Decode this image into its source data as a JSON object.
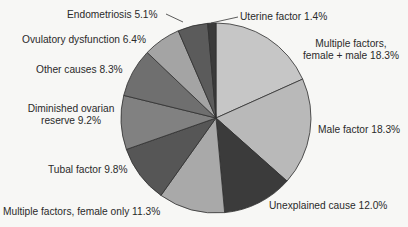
{
  "chart_data": {
    "type": "pie",
    "title": "",
    "start_angle_deg": 0,
    "direction": "clockwise",
    "center": [
      216,
      118
    ],
    "radius": 95,
    "slices": [
      {
        "label": "Multiple factors, female + male",
        "value": 18.3,
        "color": "#c6c6c6"
      },
      {
        "label": "Male factor",
        "value": 18.3,
        "color": "#b9b9b9"
      },
      {
        "label": "Unexplained cause",
        "value": 12.0,
        "color": "#3b3b3b"
      },
      {
        "label": "Multiple factors, female only",
        "value": 11.3,
        "color": "#a9a9a9"
      },
      {
        "label": "Tubal factor",
        "value": 9.8,
        "color": "#565656"
      },
      {
        "label": "Diminished ovarian reserve",
        "value": 9.2,
        "color": "#818181"
      },
      {
        "label": "Other causes",
        "value": 8.3,
        "color": "#6f6f6f"
      },
      {
        "label": "Ovulatory dysfunction",
        "value": 6.4,
        "color": "#a4a4a4"
      },
      {
        "label": "Endometriosis",
        "value": 5.1,
        "color": "#5b5b5b"
      },
      {
        "label": "Uterine factor",
        "value": 1.4,
        "color": "#3a3a3a"
      }
    ]
  },
  "labels": {
    "mf_line1": "Multiple factors,",
    "mf_line2": "female + male 18.3%",
    "male": "Male factor 18.3%",
    "unexplained": "Unexplained cause 12.0%",
    "mfo": "Multiple factors, female only 11.3%",
    "tubal": "Tubal factor 9.8%",
    "dor_line1": "Diminished ovarian",
    "dor_line2": "reserve 9.2%",
    "other": "Other causes 8.3%",
    "ovulatory": "Ovulatory dysfunction 6.4%",
    "endometriosis": "Endometriosis 5.1%",
    "uterine": "Uterine factor 1.4%"
  },
  "style": {
    "edge_color": "#2e2e2e",
    "background": "#f7f7f5"
  }
}
